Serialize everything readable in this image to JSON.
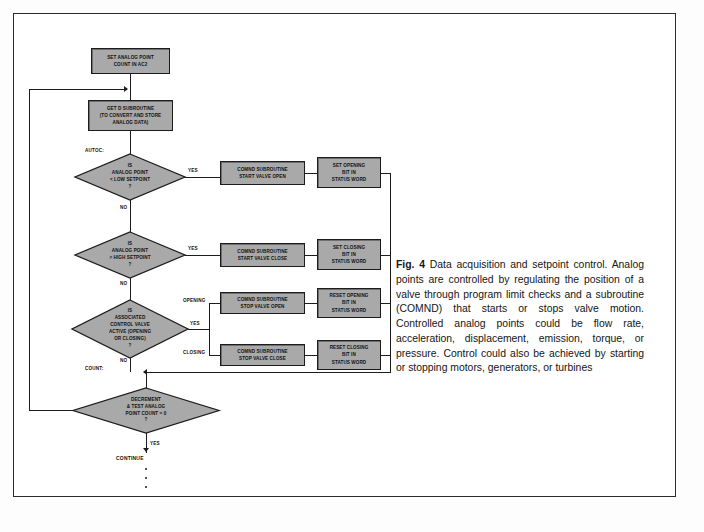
{
  "figure": {
    "caption_label": "Fig. 4",
    "caption_text": "Data acquisition and setpoint control. Analog points are controlled by regulating the position of a valve through program limit checks and a subroutine (COMND) that starts or stops valve motion. Controlled analog points could be flow rate, acceleration, displacement, emission, torque, or pressure. Control could also be achieved by starting or stopping motors, generators, or turbines"
  },
  "colors": {
    "box_fill": "#a9a9a9",
    "diamond_fill": "#a9a9a9",
    "stroke": "#1c1c1c",
    "page_bg": "#ffffff",
    "frame": "#2b2b2b"
  },
  "flowchart": {
    "nodes": {
      "set_analog_point_count": "SET ANALOG POINT\nCOUNT IN AC2",
      "get_d_subroutine": "GET D SUBROUTINE\n(TO CONVERT AND STORE\nANALOG DATA)",
      "decision_low_setpoint": "IS\nANALOG POINT\n< LOW SETPOINT\n?",
      "decision_high_setpoint": "IS\nANALOG POINT\n> HIGH SETPOINT\n?",
      "decision_valve_active": "IS\nASSOCIATED\nCONTROL VALVE\nACTIVE (OPENING\nOR CLOSING)\n?",
      "decision_count_zero": "DECREMENT\n& TEST ANALOG\nPOINT COUNT = 0\n?",
      "comnd_start_valve_open": "COMND SUBROUTINE\nSTART VALVE OPEN",
      "set_opening_bit": "SET OPENING\nBIT IN\nSTATUS WORD",
      "comnd_start_valve_close": "COMND SUBROUTINE\nSTART VALVE CLOSE",
      "set_closing_bit": "SET CLOSING\nBIT IN\nSTATUS WORD",
      "comnd_stop_valve_open": "COMND SUBROUTINE\nSTOP VALVE OPEN",
      "reset_opening_bit": "RESET OPENING\nBIT IN\nSTATUS WORD",
      "comnd_stop_valve_close": "COMND SUBROUTINE\nSTOP VALVE CLOSE",
      "reset_closing_bit": "RESET CLOSING\nBIT IN\nSTATUS WORD",
      "continue_terminal": "CONTINUE"
    },
    "labels": {
      "autoc": "AUTOC:",
      "count": "COUNT:",
      "yes_low": "YES",
      "no_low": "NO",
      "yes_high": "YES",
      "no_high": "NO",
      "yes_valve": "YES",
      "no_valve": "NO",
      "yes_count": "YES",
      "opening": "OPENING",
      "closing": "CLOSING"
    }
  }
}
